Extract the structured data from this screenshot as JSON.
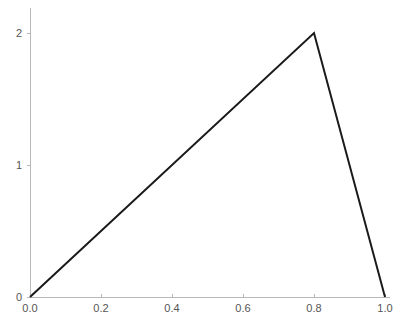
{
  "chart_data": {
    "type": "line",
    "title": "",
    "subtitle": "",
    "xlabel": "",
    "ylabel": "",
    "x": [
      0.0,
      0.8,
      1.0
    ],
    "values": [
      0,
      2,
      0
    ],
    "series": [
      {
        "name": "",
        "color": "#1a1a1a",
        "points": [
          {
            "x": 0.0,
            "y": 0
          },
          {
            "x": 0.8,
            "y": 2
          },
          {
            "x": 1.0,
            "y": 0
          }
        ]
      }
    ],
    "xlim": [
      0.0,
      1.0
    ],
    "ylim": [
      0,
      2
    ],
    "xticks": [
      0.0,
      0.2,
      0.4,
      0.6,
      0.8,
      1.0
    ],
    "yticks": [
      0,
      1,
      2
    ],
    "xtick_labels": [
      "0.0",
      "0.2",
      "0.4",
      "0.6",
      "0.8",
      "1.0"
    ],
    "ytick_labels": [
      "0",
      "1",
      "2"
    ],
    "grid": false,
    "legend": null,
    "legend_position": "none",
    "annotations": [],
    "axis_color": "#b8b8b8",
    "tick_label_color": "#555555",
    "background_color": "#ffffff",
    "spines_visible": [
      "left",
      "bottom"
    ]
  }
}
